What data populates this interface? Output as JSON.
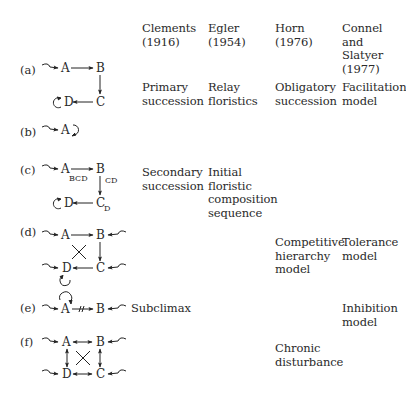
{
  "headers": [
    {
      "name": "Clements",
      "year": "(1916)"
    },
    {
      "name": "Egler",
      "year": "(1954)"
    },
    {
      "name": "Horn",
      "year": "(1976)"
    },
    {
      "name": "Connel and\nSlatyer",
      "year": "(1977)"
    }
  ],
  "rows": [
    {
      "label": "(a)",
      "clements": "Primary\nsuccession",
      "egler": "Relay\nfloristics",
      "horn": "Obligatory\nsuccession",
      "connel": "Facilitation\nmodel"
    },
    {
      "label": "(b)",
      "clements": "",
      "egler": "",
      "horn": "",
      "connel": ""
    },
    {
      "label": "(c)",
      "clements": "Secondary\nsuccession",
      "egler": "Initial\nfloristic\ncomposition\nsequence",
      "horn": "",
      "connel": ""
    },
    {
      "label": "(d)",
      "clements": "",
      "egler": "",
      "horn": "Competitive\nhierarchy\nmodel",
      "connel": "Tolerance\nmodel"
    },
    {
      "label": "(e)",
      "clements": "Subclimax",
      "egler": "",
      "horn": "",
      "connel": "Inhibition\nmodel"
    },
    {
      "label": "(f)",
      "clements": "",
      "egler": "",
      "horn": "Chronic\ndisturbance",
      "connel": ""
    }
  ],
  "nodes": {
    "a": "A",
    "b": "B",
    "c": "C",
    "d": "D"
  },
  "subscripts": {
    "c_a": "BCD",
    "c_b": "CD",
    "c_c": "D"
  }
}
